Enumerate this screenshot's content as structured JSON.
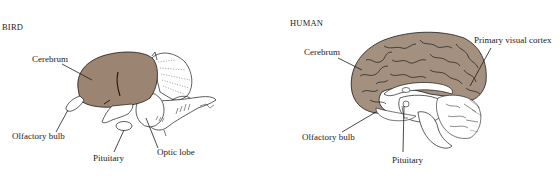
{
  "figure": {
    "panels": [
      {
        "id": "bird",
        "title": "BIRD",
        "labels": {
          "cerebrum": "Cerebrum",
          "olfactory_bulb": "Olfactory bulb",
          "pituitary": "Pituitary",
          "optic_lobe": "Optic lobe"
        }
      },
      {
        "id": "human",
        "title": "HUMAN",
        "labels": {
          "cerebrum": "Cerebrum",
          "primary_visual_cortex": "Primary visual cortex",
          "olfactory_bulb": "Olfactory bulb",
          "pituitary": "Pituitary"
        }
      }
    ]
  },
  "colors": {
    "cerebrum_fill": "#9c8472",
    "cerebrum_fill_human": "#a3907f",
    "outline": "#1a1a1a",
    "background": "#ffffff"
  }
}
